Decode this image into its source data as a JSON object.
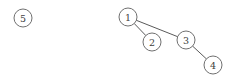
{
  "diagram": {
    "type": "graph",
    "title": "",
    "width": 235,
    "height": 84,
    "background_color": "#ffffff",
    "node_fill_color": "#ffffff",
    "node_stroke_color": "#707070",
    "edge_color": "#5a5a5a",
    "label_color": "#404040",
    "node_radius": 9,
    "nodes": [
      {
        "id": "5",
        "label": "5",
        "cx": 23,
        "cy": 18
      },
      {
        "id": "1",
        "label": "1",
        "cx": 128,
        "cy": 17
      },
      {
        "id": "2",
        "label": "2",
        "cx": 152,
        "cy": 42
      },
      {
        "id": "3",
        "label": "3",
        "cx": 186,
        "cy": 40
      },
      {
        "id": "4",
        "label": "4",
        "cx": 213,
        "cy": 65
      }
    ],
    "edges": [
      {
        "from": "1",
        "to": "2"
      },
      {
        "from": "1",
        "to": "3"
      },
      {
        "from": "3",
        "to": "4"
      }
    ],
    "isolated_nodes": [
      "5"
    ]
  }
}
